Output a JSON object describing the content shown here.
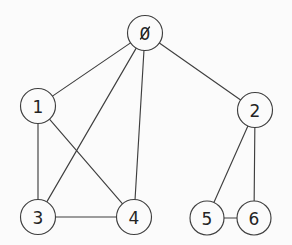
{
  "diagram": {
    "type": "undirected-graph",
    "title": "",
    "background_color": "#fbfbfb",
    "stroke_color": "#3f3f3f",
    "label_color": "#242424",
    "node_radius": 17.5,
    "node_count": 7,
    "edge_count": 10,
    "zero_glyph": "slashed-zero",
    "nodes": [
      {
        "id": "0",
        "label": "0",
        "x": 145,
        "y": 33,
        "r": 17.5
      },
      {
        "id": "1",
        "label": "1",
        "x": 38,
        "y": 106,
        "r": 17.5
      },
      {
        "id": "2",
        "label": "2",
        "x": 255,
        "y": 110,
        "r": 17.5
      },
      {
        "id": "3",
        "label": "3",
        "x": 38,
        "y": 217,
        "r": 17.5
      },
      {
        "id": "4",
        "label": "4",
        "x": 134,
        "y": 217,
        "r": 17.5
      },
      {
        "id": "5",
        "label": "5",
        "x": 207,
        "y": 218,
        "r": 17.0
      },
      {
        "id": "6",
        "label": "6",
        "x": 254,
        "y": 218,
        "r": 17.0
      }
    ],
    "edges": [
      {
        "source": "0",
        "target": "1",
        "name": "edge-0-1"
      },
      {
        "source": "0",
        "target": "2",
        "name": "edge-0-2"
      },
      {
        "source": "0",
        "target": "3",
        "name": "edge-0-3"
      },
      {
        "source": "0",
        "target": "4",
        "name": "edge-0-4"
      },
      {
        "source": "1",
        "target": "3",
        "name": "edge-1-3"
      },
      {
        "source": "1",
        "target": "4",
        "name": "edge-1-4"
      },
      {
        "source": "3",
        "target": "4",
        "name": "edge-3-4"
      },
      {
        "source": "2",
        "target": "5",
        "name": "edge-2-5"
      },
      {
        "source": "2",
        "target": "6",
        "name": "edge-2-6"
      },
      {
        "source": "5",
        "target": "6",
        "name": "edge-5-6"
      }
    ]
  }
}
